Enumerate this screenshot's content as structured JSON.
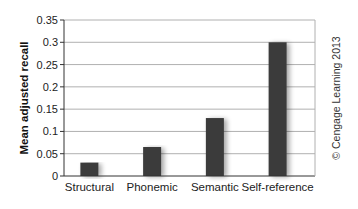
{
  "chart_data": {
    "type": "bar",
    "title": "",
    "xlabel": "",
    "ylabel": "Mean adjusted recall",
    "categories": [
      "Structural",
      "Phonemic",
      "Semantic",
      "Self-reference"
    ],
    "values": [
      0.03,
      0.065,
      0.13,
      0.3
    ],
    "ylim": [
      0,
      0.35
    ],
    "yticks": [
      "0",
      "0.05",
      "0.1",
      "0.15",
      "0.2",
      "0.25",
      "0.3",
      "0.35"
    ],
    "grid": true,
    "legend": null,
    "bar_color": "#3a3a3a",
    "grid_color": "#b0b0b0"
  },
  "credit": "© Cengage Learning 2013"
}
